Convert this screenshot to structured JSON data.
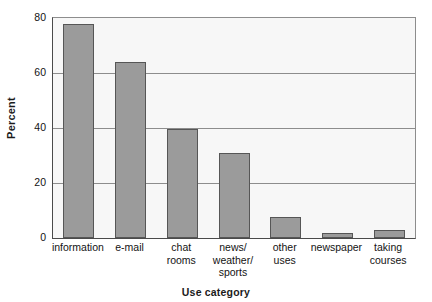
{
  "chart_data": {
    "type": "bar",
    "title": "",
    "xlabel": "Use category",
    "ylabel": "Percent",
    "categories": [
      "information",
      "e-mail",
      "chat\nrooms",
      "news/\nweather/\nsports",
      "other\nuses",
      "newspaper",
      "taking\ncourses"
    ],
    "values": [
      78,
      64,
      39.5,
      31,
      7.5,
      2,
      3
    ],
    "ylim": [
      0,
      80
    ],
    "yticks": [
      0,
      20,
      40,
      60,
      80
    ],
    "ytick_labels": [
      "0",
      "20",
      "40",
      "60",
      "80"
    ],
    "grid": true,
    "legend": "none",
    "bar_color": "#9b9b9b",
    "bar_border_color": "#565656",
    "plot_background": "#f7f7f7",
    "gridline_color": "#8d8d8d",
    "axis_color": "#4a4a4a"
  }
}
